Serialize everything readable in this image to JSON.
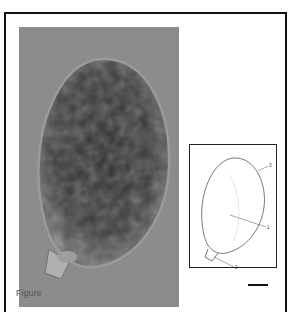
{
  "figure": {
    "photo": {
      "subject": "micrograph of ovoid cell with granular contents and short basal stalk",
      "background_color": "#8c8c8c",
      "cell_color": "#2e2e2e"
    },
    "drawing": {
      "labels": [
        "3",
        "1",
        "2"
      ]
    },
    "scale_bar": {
      "present": true
    },
    "caption": {
      "text": "Figure"
    }
  }
}
